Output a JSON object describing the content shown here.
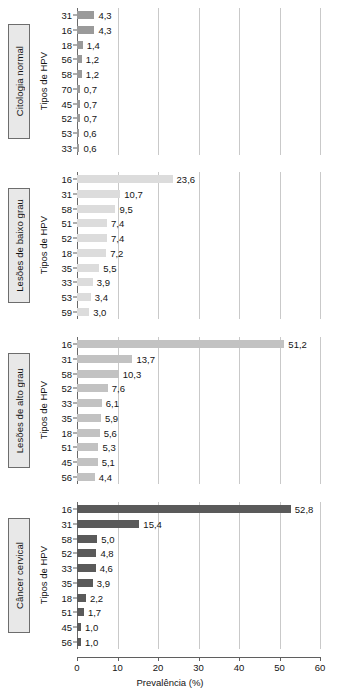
{
  "chart_data": {
    "type": "bar",
    "orientation": "horizontal",
    "title": "",
    "xlabel": "Prevalência (%)",
    "ylabel": "Tipos de HPV",
    "xlim": [
      0,
      60
    ],
    "xticks": [
      "0",
      "10",
      "20",
      "30",
      "40",
      "50",
      "60"
    ],
    "grid": "vertical",
    "legend": "none",
    "panels": [
      {
        "label": "Citologia normal",
        "ylabel": "Tipos de HPV",
        "bar_color": "#9a9a9a",
        "categories": [
          "31",
          "16",
          "18",
          "56",
          "58",
          "70",
          "45",
          "52",
          "53",
          "33"
        ],
        "values": [
          4.3,
          4.3,
          1.4,
          1.2,
          1.2,
          0.7,
          0.7,
          0.7,
          0.6,
          0.6
        ],
        "value_labels": [
          "4,3",
          "4,3",
          "1,4",
          "1,2",
          "1,2",
          "0,7",
          "0,7",
          "0,7",
          "0,6",
          "0,6"
        ]
      },
      {
        "label": "Lesões de baixo grau",
        "ylabel": "Tipos de HPV",
        "bar_color": "#dcdcdc",
        "categories": [
          "16",
          "31",
          "58",
          "51",
          "52",
          "18",
          "35",
          "33",
          "53",
          "59"
        ],
        "values": [
          23.6,
          10.7,
          9.5,
          7.4,
          7.4,
          7.2,
          5.5,
          3.9,
          3.4,
          3.0
        ],
        "value_labels": [
          "23,6",
          "10,7",
          "9,5",
          "7,4",
          "7,4",
          "7,2",
          "5,5",
          "3,9",
          "3,4",
          "3,0"
        ]
      },
      {
        "label": "Lesões de alto grau",
        "ylabel": "Tipos de HPV",
        "bar_color": "#c2c2c2",
        "categories": [
          "16",
          "31",
          "58",
          "52",
          "33",
          "35",
          "18",
          "51",
          "45",
          "56"
        ],
        "values": [
          51.2,
          13.7,
          10.3,
          7.6,
          6.1,
          5.9,
          5.6,
          5.3,
          5.1,
          4.4
        ],
        "value_labels": [
          "51,2",
          "13,7",
          "10,3",
          "7,6",
          "6,1",
          "5,9",
          "5,6",
          "5,3",
          "5,1",
          "4,4"
        ]
      },
      {
        "label": "Câncer cervical",
        "ylabel": "Tipos de HPV",
        "bar_color": "#5a5a5a",
        "categories": [
          "16",
          "31",
          "58",
          "52",
          "33",
          "35",
          "18",
          "51",
          "45",
          "56"
        ],
        "values": [
          52.8,
          15.4,
          5.0,
          4.8,
          4.6,
          3.9,
          2.2,
          1.7,
          1.0,
          1.0
        ],
        "value_labels": [
          "52,8",
          "15,4",
          "5,0",
          "4,8",
          "4,6",
          "3,9",
          "2,2",
          "1,7",
          "1,0",
          "1,0"
        ]
      }
    ]
  },
  "colors": {
    "gridline": "#c9c9c9",
    "axis": "#5f5f5f",
    "text": "#141414",
    "box_fill": "#e8e8e8",
    "box_border": "#6d6d6d"
  }
}
